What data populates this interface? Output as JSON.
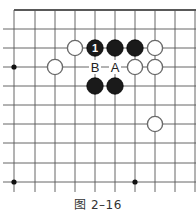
{
  "caption": "图 2–16",
  "board": {
    "vertical_lines_x": [
      14,
      35,
      55,
      75,
      95,
      115,
      135,
      155,
      175,
      195
    ],
    "horizontal_lines_y": [
      10,
      29,
      48,
      67,
      86,
      105,
      124,
      143,
      163,
      182
    ],
    "line_color": "#555555",
    "star_points": [
      [
        0,
        3
      ],
      [
        0,
        9
      ],
      [
        6,
        9
      ]
    ],
    "stones": [
      {
        "color": "white",
        "col": 3,
        "row": 2
      },
      {
        "color": "black",
        "col": 4,
        "row": 2,
        "label": "1"
      },
      {
        "color": "black",
        "col": 5,
        "row": 2
      },
      {
        "color": "black",
        "col": 6,
        "row": 2
      },
      {
        "color": "white",
        "col": 7,
        "row": 2
      },
      {
        "color": "white",
        "col": 2,
        "row": 3
      },
      {
        "color": "white",
        "col": 6,
        "row": 3
      },
      {
        "color": "white",
        "col": 7,
        "row": 3
      },
      {
        "color": "black",
        "col": 4,
        "row": 4
      },
      {
        "color": "black",
        "col": 5,
        "row": 4
      },
      {
        "color": "white",
        "col": 7,
        "row": 6
      }
    ],
    "markers": [
      {
        "label": "B",
        "col": 4,
        "row": 3
      },
      {
        "label": "A",
        "col": 5,
        "row": 3
      }
    ]
  }
}
